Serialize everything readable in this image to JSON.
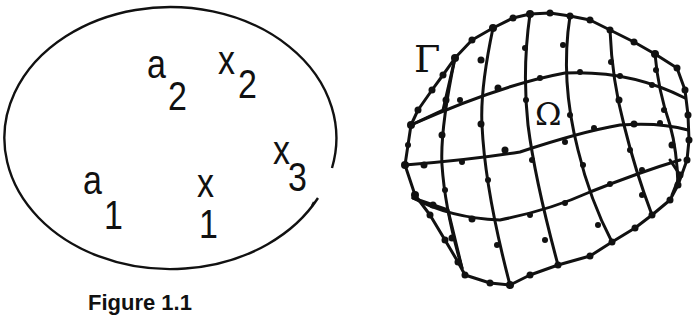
{
  "figure_left": {
    "caption": "Figure 1.1",
    "shape": "ellipse",
    "labels": [
      {
        "id": "a1",
        "base": "a",
        "sub": "1"
      },
      {
        "id": "a2",
        "base": "a",
        "sub": "2"
      },
      {
        "id": "x1",
        "base": "x",
        "sub": "1"
      },
      {
        "id": "x2",
        "base": "x",
        "sub": "2"
      },
      {
        "id": "x3",
        "base": "x",
        "sub": "3"
      }
    ]
  },
  "figure_right": {
    "boundary_label": "Γ",
    "domain_label": "Ω",
    "description": "curvilinear quadrilateral finite element mesh with boundary nodes"
  },
  "colors": {
    "ink": "#111111",
    "background": "#ffffff"
  }
}
